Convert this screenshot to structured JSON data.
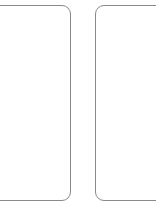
{
  "canvas": {
    "width": 156,
    "height": 218,
    "background_color": "#ffffff",
    "description": "Two blank rounded-rectangle outlines side by side on a white background, both cropped at the image edges"
  },
  "style": {
    "stroke_color": "#8a8a8a",
    "stroke_width_px": 1.2,
    "corner_radius_px": 9,
    "fill_color": "#ffffff"
  },
  "shapes": [
    {
      "name": "left-rounded-rectangle",
      "label": "",
      "x": -34,
      "y": 5,
      "width": 105,
      "height": 196,
      "clipped_edge": "left",
      "visible_right_edge_x": 70,
      "top_edge_y": 5,
      "bottom_edge_y": 201
    },
    {
      "name": "right-rounded-rectangle",
      "label": "",
      "x": 95,
      "y": 5,
      "width": 105,
      "height": 196,
      "clipped_edge": "right",
      "visible_left_edge_x": 95,
      "top_edge_y": 5,
      "bottom_edge_y": 201
    }
  ],
  "gap": {
    "between_shapes_px": 25,
    "left_shape_right_edge_x": 70,
    "right_shape_left_edge_x": 95
  },
  "blank_region": {
    "below_shapes_top_y": 202,
    "height_px": 16
  }
}
